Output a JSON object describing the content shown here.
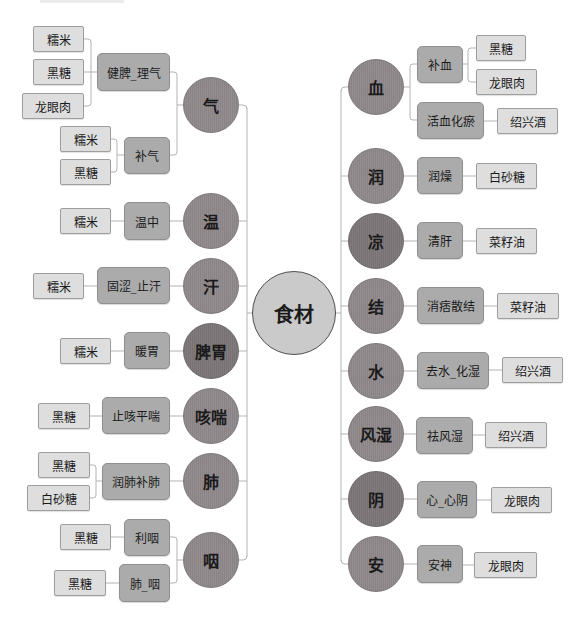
{
  "diagram": {
    "type": "mind-map",
    "center": {
      "label": "食材"
    },
    "left": [
      {
        "label": "气",
        "children": [
          {
            "label": "健脾_理气",
            "items": [
              "糯米",
              "黑糖",
              "龙眼肉"
            ]
          },
          {
            "label": "补气",
            "items": [
              "糯米",
              "黑糖"
            ]
          }
        ]
      },
      {
        "label": "温",
        "children": [
          {
            "label": "温中",
            "items": [
              "糯米"
            ]
          }
        ]
      },
      {
        "label": "汗",
        "children": [
          {
            "label": "固涩_止汗",
            "items": [
              "糯米"
            ]
          }
        ]
      },
      {
        "label": "脾胃",
        "children": [
          {
            "label": "暖胃",
            "items": [
              "糯米"
            ]
          }
        ]
      },
      {
        "label": "咳喘",
        "children": [
          {
            "label": "止咳平喘",
            "items": [
              "黑糖"
            ]
          }
        ]
      },
      {
        "label": "肺",
        "children": [
          {
            "label": "润肺补肺",
            "items": [
              "黑糖",
              "白砂糖"
            ]
          }
        ]
      },
      {
        "label": "咽",
        "children": [
          {
            "label": "利咽",
            "items": [
              "黑糖"
            ]
          },
          {
            "label": "肺_咽",
            "items": [
              "黑糖"
            ]
          }
        ]
      }
    ],
    "right": [
      {
        "label": "血",
        "children": [
          {
            "label": "补血",
            "items": [
              "黑糖",
              "龙眼肉"
            ]
          },
          {
            "label": "活血化瘀",
            "items": [
              "绍兴酒"
            ]
          }
        ]
      },
      {
        "label": "润",
        "children": [
          {
            "label": "润燥",
            "items": [
              "白砂糖"
            ]
          }
        ]
      },
      {
        "label": "凉",
        "children": [
          {
            "label": "清肝",
            "items": [
              "菜籽油"
            ]
          }
        ]
      },
      {
        "label": "结",
        "children": [
          {
            "label": "消痞散结",
            "items": [
              "菜籽油"
            ]
          }
        ]
      },
      {
        "label": "水",
        "children": [
          {
            "label": "去水_化湿",
            "items": [
              "绍兴酒"
            ]
          }
        ]
      },
      {
        "label": "风湿",
        "children": [
          {
            "label": "祛风湿",
            "items": [
              "绍兴酒"
            ]
          }
        ]
      },
      {
        "label": "阴",
        "children": [
          {
            "label": "心_心阴",
            "items": [
              "龙眼肉"
            ]
          }
        ]
      },
      {
        "label": "安",
        "children": [
          {
            "label": "安神",
            "items": [
              "龙眼肉"
            ]
          }
        ]
      }
    ]
  },
  "colors": {
    "center_fill": "#cacaca",
    "topic_fill": "#8e878a",
    "topic_fill_dark": "#7c7678",
    "mid_fill": "#ababab",
    "leaf_fill": "#dedede",
    "connector": "#b3b3b3"
  }
}
